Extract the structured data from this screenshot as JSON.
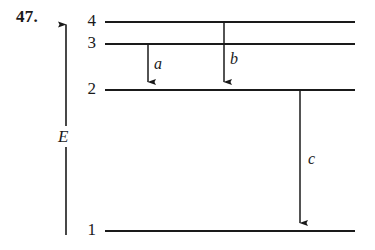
{
  "figure": {
    "problem_number": "47.",
    "axis_label": "E",
    "levels": [
      {
        "label": "4",
        "y": 22
      },
      {
        "label": "3",
        "y": 44
      },
      {
        "label": "2",
        "y": 90
      },
      {
        "label": "1",
        "y": 231
      }
    ],
    "transitions": [
      {
        "label": "a",
        "from_level": "3",
        "to_level": "2",
        "x": 148,
        "y1": 44,
        "y2": 90
      },
      {
        "label": "b",
        "from_level": "4",
        "to_level": "2",
        "x": 224,
        "y1": 22,
        "y2": 90
      },
      {
        "label": "c",
        "from_level": "2",
        "to_level": "1",
        "x": 300,
        "y1": 90,
        "y2": 231
      }
    ],
    "colors": {
      "ink": "#1a1a1a",
      "background": "#ffffff"
    }
  }
}
